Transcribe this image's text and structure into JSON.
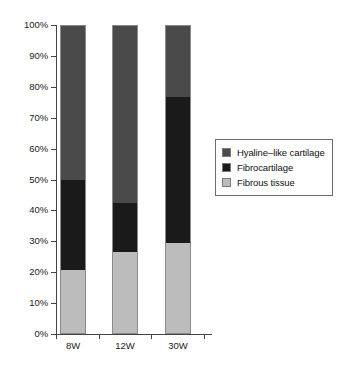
{
  "chart_data": {
    "type": "bar",
    "subtype": "stacked-percentage",
    "title": "",
    "xlabel": "",
    "ylabel": "",
    "categories": [
      "8W",
      "12W",
      "30W"
    ],
    "series": [
      {
        "name": "Fibrous tissue",
        "color": "#bcbcbc",
        "values": [
          20.7,
          26.5,
          29.4
        ]
      },
      {
        "name": "Fibrocartilage",
        "color": "#1a1a1a",
        "values": [
          29.3,
          15.9,
          47.3
        ]
      },
      {
        "name": "Hyaline–like cartilage",
        "color": "#4a4a4a",
        "values": [
          50.0,
          57.6,
          23.3
        ]
      }
    ],
    "stack_order_bottom_to_top": [
      "Fibrous tissue",
      "Fibrocartilage",
      "Hyaline–like cartilage"
    ],
    "cumulative_boundaries_pct": {
      "8W": [
        20.7,
        50.0,
        100.0
      ],
      "12W": [
        26.5,
        42.4,
        100.0
      ],
      "30W": [
        29.4,
        76.7,
        100.0
      ]
    },
    "ylim": [
      0,
      100
    ],
    "ytick_values": [
      0,
      10,
      20,
      30,
      40,
      50,
      60,
      70,
      80,
      90,
      100
    ],
    "ytick_labels": [
      "0%",
      "10%",
      "20%",
      "30%",
      "40%",
      "50%",
      "60%",
      "70%",
      "80%",
      "90%",
      "100%"
    ],
    "grid": false,
    "legend_position": "right"
  },
  "legend": {
    "entries": [
      {
        "label": "Hyaline–like cartilage",
        "color": "#4a4a4a"
      },
      {
        "label": "Fibrocartilage",
        "color": "#1a1a1a"
      },
      {
        "label": "Fibrous tissue",
        "color": "#bcbcbc"
      }
    ]
  },
  "axes": {
    "y_labels": [
      "100%",
      "90%",
      "80%",
      "70%",
      "60%",
      "50%",
      "40%",
      "30%",
      "20%",
      "10%",
      "0%"
    ],
    "x_labels": [
      "8W",
      "12W",
      "30W"
    ]
  }
}
